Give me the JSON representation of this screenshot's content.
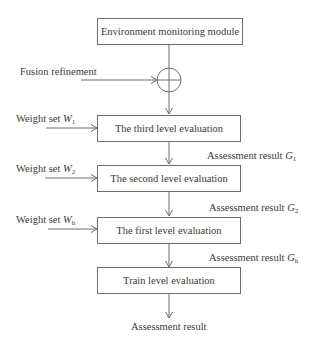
{
  "diagram": {
    "type": "flowchart",
    "nodes": {
      "env": "Environment monitoring module",
      "third": "The third level evaluation",
      "second": "The second level evaluation",
      "first": "The first level evaluation",
      "train": "Train level evaluation"
    },
    "inputs": {
      "fusion": "Fusion refinement",
      "w1_prefix": "Weight set ",
      "w1_var": "W",
      "w1_sub": "1",
      "w2_prefix": "Weight set ",
      "w2_var": "W",
      "w2_sub": "2",
      "wh_prefix": "Weight set ",
      "wh_var": "W",
      "wh_sub": "h"
    },
    "outputs": {
      "g1_prefix": "Assessment result ",
      "g1_var": "G",
      "g1_sub": "1",
      "g2_prefix": "Assessment result ",
      "g2_var": "G",
      "g2_sub": "2",
      "gh_prefix": "Assessment result ",
      "gh_var": "G",
      "gh_sub": "h",
      "final": "Assessment result"
    },
    "colors": {
      "line": "#6e6e6e",
      "text": "#3a3a3a"
    }
  }
}
